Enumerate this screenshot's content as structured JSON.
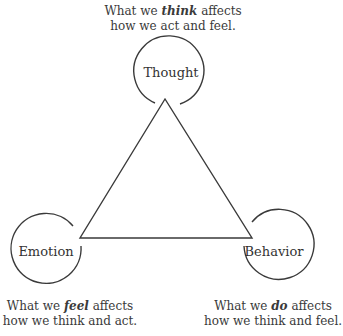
{
  "diagram": {
    "type": "cognitive-triangle",
    "stroke_color": "#3a3a3a",
    "nodes": [
      {
        "id": "thought",
        "label": "Thought"
      },
      {
        "id": "emotion",
        "label": "Emotion"
      },
      {
        "id": "behavior",
        "label": "Behavior"
      }
    ],
    "edges": [
      {
        "from": "thought",
        "to": "emotion"
      },
      {
        "from": "emotion",
        "to": "behavior"
      },
      {
        "from": "behavior",
        "to": "thought"
      }
    ],
    "captions": {
      "thought": {
        "pre": "What we ",
        "emph": "think",
        "post": " affects",
        "line2": "how we act and feel."
      },
      "emotion": {
        "pre": "What we ",
        "emph": "feel",
        "post": " affects",
        "line2": "how we think and act."
      },
      "behavior": {
        "pre": "What we ",
        "emph": "do",
        "post": " affects",
        "line2": "how we think and feel."
      }
    }
  }
}
